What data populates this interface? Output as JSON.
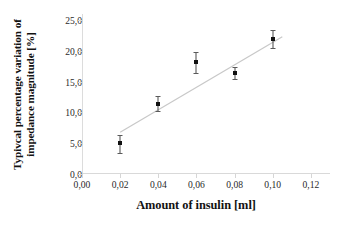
{
  "chart_data": {
    "type": "scatter",
    "title": "",
    "xlabel": "Amount of insulin [ml]",
    "ylabel_line1": "Typivcal percentage variation of",
    "ylabel_line2": "impedance magnitude  [%]",
    "ylabel": "Typivcal percentage variation of impedance magnitude  [%]",
    "xlim": [
      0.0,
      0.13
    ],
    "ylim": [
      0.0,
      26.0
    ],
    "grid": false,
    "legend": "none",
    "xticks": [
      0.0,
      0.02,
      0.04,
      0.06,
      0.08,
      0.1,
      0.12
    ],
    "xticklabels": [
      "0,00",
      "0,02",
      "0,04",
      "0,06",
      "0,08",
      "0,10",
      "0,12"
    ],
    "yticks": [
      0.0,
      5.0,
      10.0,
      15.0,
      20.0,
      25.0
    ],
    "yticklabels": [
      "0,0",
      "5,0",
      "10,0",
      "15,0",
      "20,0",
      "25,0"
    ],
    "x": [
      0.02,
      0.04,
      0.06,
      0.08,
      0.1
    ],
    "y": [
      5.0,
      11.4,
      18.2,
      16.4,
      22.0
    ],
    "yerr_low": [
      1.6,
      1.1,
      1.8,
      1.0,
      1.5
    ],
    "yerr_high": [
      1.3,
      1.2,
      1.6,
      1.0,
      1.4
    ],
    "series": [
      {
        "name": "measurements",
        "marker": "square",
        "color": "#111111",
        "values": [
          5.0,
          11.4,
          18.2,
          16.4,
          22.0
        ]
      },
      {
        "name": "linear fit",
        "type": "line",
        "color": "#c8c8c8",
        "x_start": 0.02,
        "y_start": 6.8,
        "x_end": 0.105,
        "y_end": 22.3
      }
    ],
    "axis_color": "#d9d9d9",
    "marker_color": "#111111",
    "fit_color": "#c9c9c9"
  }
}
